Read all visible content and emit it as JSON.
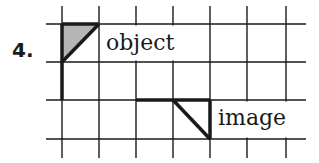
{
  "problem": {
    "number_label": "4.",
    "object_label": "object",
    "image_label": "image"
  },
  "grid": {
    "x_lines": [
      62,
      99,
      136,
      173,
      210,
      247,
      286
    ],
    "y_lines": [
      24,
      62,
      100,
      139
    ],
    "x_extent": [
      46,
      306
    ],
    "y_extent": [
      6,
      158
    ],
    "line_color": "#1a1a1a"
  },
  "object_shape": {
    "description": "shaded right triangle in upper-left cell with vertical stem extending down",
    "fill": "#b5b5b5",
    "stroke": "#1a1a1a"
  },
  "image_shape": {
    "description": "right triangle outline in lower row, cell between x 173-210",
    "stroke": "#1a1a1a"
  }
}
